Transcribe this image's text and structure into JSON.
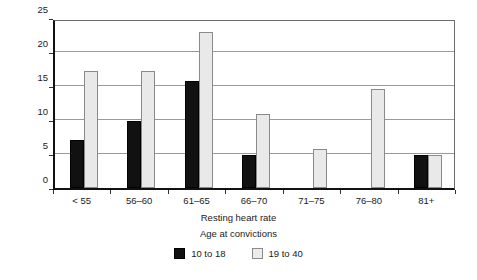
{
  "chart_data": {
    "type": "bar",
    "title": "",
    "subtitle": "",
    "xlabel": "Resting heart rate",
    "ylabel": "Percentage of males convicted",
    "categories": [
      "< 55",
      "56–60",
      "61–65",
      "66–70",
      "71–75",
      "76–80",
      "81+"
    ],
    "ylim": [
      0,
      25
    ],
    "yticks": [
      0,
      5,
      10,
      15,
      20,
      25
    ],
    "grid": true,
    "legend_title": "Age at convictions",
    "legend_position": "bottom",
    "series": [
      {
        "name": "10 to 18",
        "color": "#111111",
        "values": [
          7.0,
          9.8,
          15.8,
          4.8,
          0,
          0,
          4.8
        ]
      },
      {
        "name": "19 to 40",
        "color": "#e9e9e9",
        "values": [
          17.2,
          17.2,
          23.0,
          10.9,
          5.7,
          14.6,
          4.8
        ]
      }
    ]
  }
}
